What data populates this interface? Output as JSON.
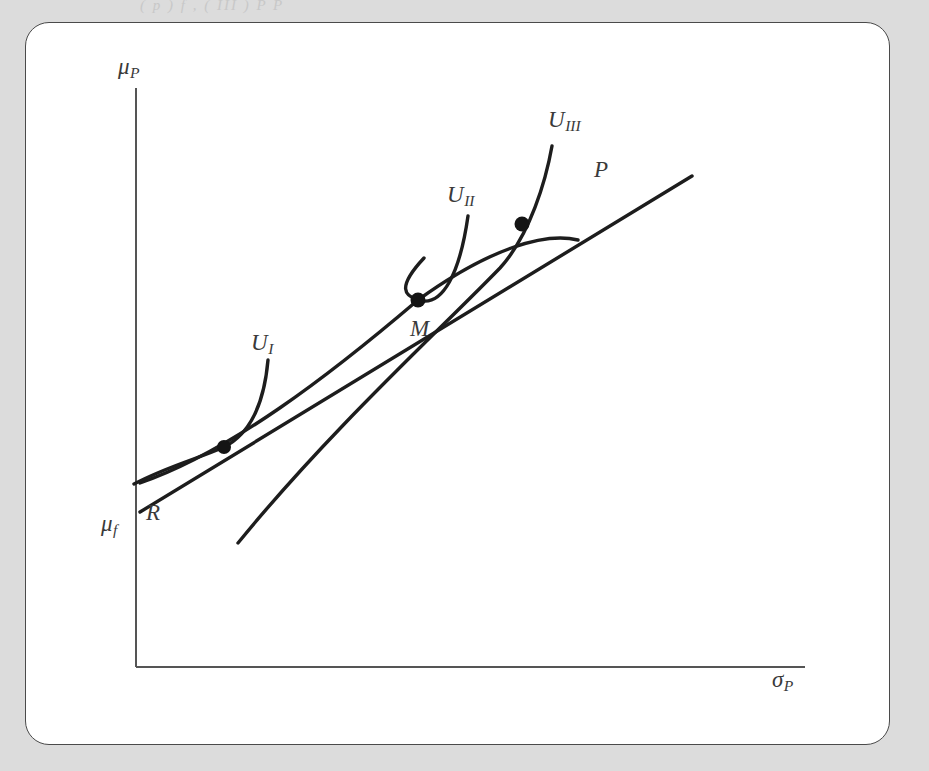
{
  "page": {
    "background_color": "#dcdcdc",
    "panel_color": "#ffffff",
    "panel_border_color": "#4a4a4a",
    "top_text_fragment": "( p )                 f                     ,                                      ( III )          P                  P"
  },
  "chart_data": {
    "type": "line",
    "title": "",
    "xlabel": "σ",
    "xlabel_sub": "P",
    "ylabel": "μ",
    "ylabel_sub": "P",
    "grid": false,
    "legend": "none",
    "axis": {
      "origin": [
        136,
        667
      ],
      "x_end": [
        805,
        667
      ],
      "y_end": [
        136,
        88
      ]
    },
    "axis_labels": [
      {
        "name": "y-axis-label",
        "base": "μ",
        "sub": "P",
        "x": 118,
        "y": 55
      },
      {
        "name": "x-axis-label",
        "base": "σ",
        "sub": "P",
        "x": 772,
        "y": 668
      },
      {
        "name": "risk-free-rate-label",
        "base": "μ",
        "sub": "f",
        "x": 101,
        "y": 512
      }
    ],
    "series": [
      {
        "name": "efficient-frontier",
        "label": "",
        "style": "concave-curve",
        "path": "M 140 483 C 230 452 330 375 418 300 C 490 248 545 232 578 240"
      },
      {
        "name": "capital-market-line",
        "label": "P",
        "style": "straight-ray",
        "path": "M 140 512 L 692 176"
      },
      {
        "name": "indifference-curve-I",
        "label": "U",
        "label_sub": "I",
        "style": "convex-curve",
        "path": "M 134 484 C 168 466 200 458 224 447 C 250 434 264 405 268 360"
      },
      {
        "name": "indifference-curve-II",
        "label": "U",
        "label_sub": "II",
        "style": "convex-curve",
        "path": "M 424 258 C 396 288 405 296 418 300 C 443 308 460 272 468 216"
      },
      {
        "name": "indifference-curve-III",
        "label": "U",
        "label_sub": "III",
        "style": "convex-curve",
        "path": "M 238 543 C 330 430 440 330 500 268 C 530 235 546 180 552 146"
      }
    ],
    "points": [
      {
        "name": "tangency-point-I",
        "label": "",
        "x": 224,
        "y": 447,
        "r": 7
      },
      {
        "name": "tangency-point-M",
        "label": "M",
        "x": 418,
        "y": 300,
        "r": 7.5
      },
      {
        "name": "tangency-point-III",
        "label": "",
        "x": 522,
        "y": 224,
        "r": 7.5
      }
    ],
    "curve_labels": [
      {
        "name": "label-u1",
        "base": "U",
        "sub": "I",
        "x": 251,
        "y": 331
      },
      {
        "name": "label-u2",
        "base": "U",
        "sub": "II",
        "x": 447,
        "y": 183
      },
      {
        "name": "label-u3",
        "base": "U",
        "sub": "III",
        "x": 548,
        "y": 108
      },
      {
        "name": "label-p",
        "base": "P",
        "sub": "",
        "x": 594,
        "y": 158
      },
      {
        "name": "label-m",
        "base": "M",
        "sub": "",
        "x": 410,
        "y": 317
      },
      {
        "name": "label-r",
        "base": "R",
        "sub": "",
        "x": 146,
        "y": 501
      }
    ]
  }
}
